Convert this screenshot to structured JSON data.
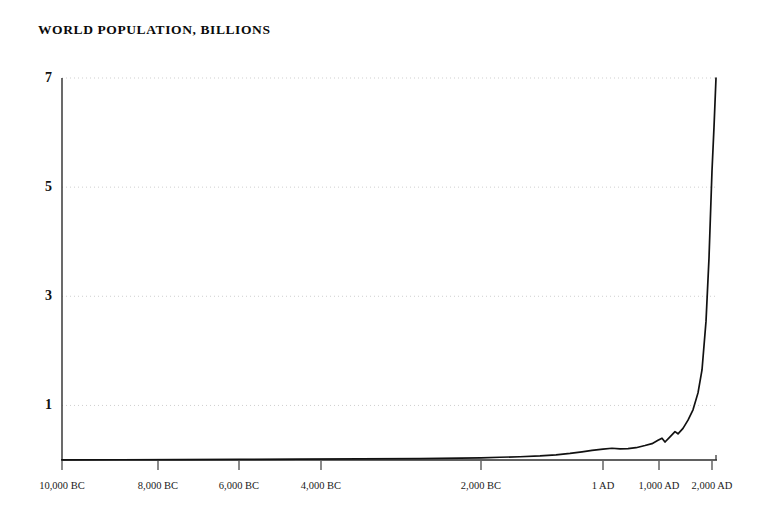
{
  "chart_data": {
    "type": "line",
    "title": "WORLD POPULATION, BILLIONS",
    "xlabel": "",
    "ylabel": "",
    "ylim": [
      0,
      7.4
    ],
    "grid": true,
    "legend": false,
    "y_ticks": [
      {
        "label": "1",
        "value": 1
      },
      {
        "label": "3",
        "value": 3
      },
      {
        "label": "5",
        "value": 5
      },
      {
        "label": "7",
        "value": 7
      }
    ],
    "x_ticks": [
      {
        "label": "10,000 BC",
        "year": -10000,
        "px": 62
      },
      {
        "label": "8,000 BC",
        "year": -8000,
        "px": 158
      },
      {
        "label": "6,000 BC",
        "year": -6000,
        "px": 239
      },
      {
        "label": "4,000 BC",
        "year": -4000,
        "px": 321
      },
      {
        "label": "2,000 BC",
        "year": -2000,
        "px": 481
      },
      {
        "label": "1 AD",
        "year": 1,
        "px": 603
      },
      {
        "label": "1,000 AD",
        "year": 1000,
        "px": 659
      },
      {
        "label": "2,000 AD",
        "year": 2000,
        "px": 712
      }
    ],
    "axis_note": "horizontal axis is non-uniform; recent millennia are compressed at the right edge",
    "series": [
      {
        "name": "World population",
        "units": "billions",
        "points": [
          {
            "x": 62,
            "year": -10000,
            "value": 0.004
          },
          {
            "x": 120,
            "year": -8800,
            "value": 0.005
          },
          {
            "x": 180,
            "year": -7500,
            "value": 0.006
          },
          {
            "x": 240,
            "year": -6000,
            "value": 0.01
          },
          {
            "x": 300,
            "year": -4500,
            "value": 0.015
          },
          {
            "x": 360,
            "year": -3200,
            "value": 0.02
          },
          {
            "x": 420,
            "year": -2600,
            "value": 0.027
          },
          {
            "x": 460,
            "year": -2200,
            "value": 0.035
          },
          {
            "x": 481,
            "year": -2000,
            "value": 0.04
          },
          {
            "x": 500,
            "year": -1700,
            "value": 0.05
          },
          {
            "x": 520,
            "year": -1400,
            "value": 0.06
          },
          {
            "x": 540,
            "year": -1000,
            "value": 0.075
          },
          {
            "x": 556,
            "year": -700,
            "value": 0.095
          },
          {
            "x": 570,
            "year": -500,
            "value": 0.12
          },
          {
            "x": 582,
            "year": -300,
            "value": 0.15
          },
          {
            "x": 592,
            "year": -150,
            "value": 0.175
          },
          {
            "x": 603,
            "year": 1,
            "value": 0.2
          },
          {
            "x": 612,
            "year": 200,
            "value": 0.215
          },
          {
            "x": 620,
            "year": 400,
            "value": 0.205
          },
          {
            "x": 628,
            "year": 600,
            "value": 0.21
          },
          {
            "x": 636,
            "year": 800,
            "value": 0.225
          },
          {
            "x": 645,
            "year": 1000,
            "value": 0.265
          },
          {
            "x": 652,
            "year": 1150,
            "value": 0.3
          },
          {
            "x": 658,
            "year": 1250,
            "value": 0.36
          },
          {
            "x": 662,
            "year": 1340,
            "value": 0.4
          },
          {
            "x": 665,
            "year": 1400,
            "value": 0.33
          },
          {
            "x": 670,
            "year": 1500,
            "value": 0.425
          },
          {
            "x": 675,
            "year": 1600,
            "value": 0.52
          },
          {
            "x": 678,
            "year": 1650,
            "value": 0.48
          },
          {
            "x": 683,
            "year": 1700,
            "value": 0.58
          },
          {
            "x": 688,
            "year": 1750,
            "value": 0.73
          },
          {
            "x": 693,
            "year": 1800,
            "value": 0.92
          },
          {
            "x": 698,
            "year": 1850,
            "value": 1.23
          },
          {
            "x": 702,
            "year": 1900,
            "value": 1.65
          },
          {
            "x": 706,
            "year": 1950,
            "value": 2.54
          },
          {
            "x": 709,
            "year": 1970,
            "value": 3.7
          },
          {
            "x": 712,
            "year": 1990,
            "value": 5.3
          },
          {
            "x": 714,
            "year": 2000,
            "value": 6.1
          },
          {
            "x": 716,
            "year": 2011,
            "value": 7.0
          }
        ]
      }
    ]
  },
  "colors": {
    "background": "#ffffff",
    "axis": "#2b2b2b",
    "line": "#111111",
    "grid": "#c9c9c9",
    "text": "#111111"
  }
}
